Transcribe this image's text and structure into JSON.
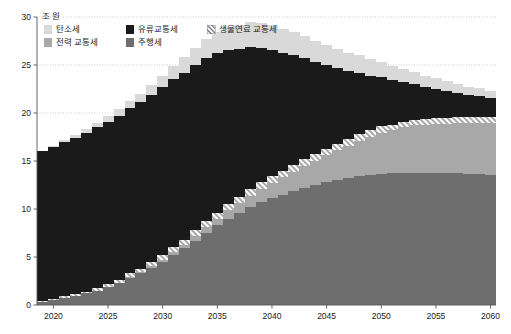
{
  "chart_data": {
    "type": "bar",
    "title": "",
    "subtitle": "",
    "unit_label": "조 원",
    "xlabel": "",
    "ylabel": "",
    "ylim": [
      0,
      30
    ],
    "xlim": [
      2018.5,
      2060.5
    ],
    "y_ticks": [
      "0",
      "5",
      "10",
      "15",
      "20",
      "25",
      "30"
    ],
    "y_tick_values": [
      0,
      5,
      10,
      15,
      20,
      25,
      30
    ],
    "x_ticks": [
      "2020",
      "2025",
      "2030",
      "2035",
      "2040",
      "2045",
      "2050",
      "2055",
      "2060"
    ],
    "x_tick_values": [
      2020,
      2025,
      2030,
      2035,
      2040,
      2045,
      2050,
      2055,
      2060
    ],
    "grid": "horizontal-dotted",
    "stacked": true,
    "legend_position": "top-left",
    "x": [
      2019,
      2020,
      2021,
      2022,
      2023,
      2024,
      2025,
      2026,
      2027,
      2028,
      2029,
      2030,
      2031,
      2032,
      2033,
      2034,
      2035,
      2036,
      2037,
      2038,
      2039,
      2040,
      2041,
      2042,
      2043,
      2044,
      2045,
      2046,
      2047,
      2048,
      2049,
      2050,
      2051,
      2052,
      2053,
      2054,
      2055,
      2056,
      2057,
      2058,
      2059,
      2060
    ],
    "series": [
      {
        "name": "주행세",
        "color": "#6e6e6e",
        "pattern": "solid",
        "values": [
          0.3,
          0.5,
          0.7,
          0.9,
          1.2,
          1.5,
          1.9,
          2.3,
          2.8,
          3.3,
          3.9,
          4.5,
          5.2,
          5.9,
          6.7,
          7.5,
          8.3,
          9.0,
          9.6,
          10.2,
          10.7,
          11.1,
          11.5,
          11.9,
          12.2,
          12.5,
          12.8,
          13.0,
          13.2,
          13.4,
          13.5,
          13.6,
          13.7,
          13.8,
          13.8,
          13.8,
          13.8,
          13.7,
          13.7,
          13.6,
          13.6,
          13.5
        ]
      },
      {
        "name": "전력 교통세",
        "color": "#a8a8a8",
        "pattern": "solid",
        "values": [
          0.0,
          0.0,
          0.0,
          0.0,
          0.0,
          0.0,
          0.0,
          0.0,
          0.1,
          0.1,
          0.2,
          0.2,
          0.3,
          0.4,
          0.5,
          0.6,
          0.7,
          0.9,
          1.0,
          1.2,
          1.4,
          1.6,
          1.8,
          2.0,
          2.3,
          2.5,
          2.8,
          3.1,
          3.4,
          3.7,
          4.0,
          4.3,
          4.5,
          4.7,
          4.9,
          5.0,
          5.1,
          5.2,
          5.3,
          5.4,
          5.4,
          5.5
        ]
      },
      {
        "name": "생물연료 교통세",
        "color": "#f2f2f2",
        "pattern": "diagonal-hatch",
        "values": [
          0.1,
          0.1,
          0.2,
          0.2,
          0.2,
          0.3,
          0.3,
          0.3,
          0.4,
          0.4,
          0.4,
          0.5,
          0.5,
          0.5,
          0.6,
          0.6,
          0.6,
          0.6,
          0.6,
          0.7,
          0.7,
          0.7,
          0.7,
          0.7,
          0.7,
          0.7,
          0.7,
          0.7,
          0.7,
          0.7,
          0.7,
          0.7,
          0.6,
          0.6,
          0.6,
          0.6,
          0.6,
          0.6,
          0.6,
          0.6,
          0.6,
          0.6
        ]
      },
      {
        "name": "유류교통세",
        "color": "#1a1a1a",
        "pattern": "solid",
        "values": [
          15.6,
          15.9,
          16.1,
          16.3,
          16.5,
          16.7,
          16.9,
          17.1,
          17.2,
          17.3,
          17.4,
          17.5,
          17.5,
          17.4,
          17.2,
          17.0,
          16.6,
          16.1,
          15.5,
          14.8,
          14.0,
          13.2,
          12.3,
          11.4,
          10.5,
          9.6,
          8.7,
          7.9,
          7.1,
          6.4,
          5.7,
          5.1,
          4.6,
          4.1,
          3.7,
          3.3,
          3.0,
          2.8,
          2.5,
          2.3,
          2.2,
          2.0
        ]
      },
      {
        "name": "탄소세",
        "color": "#d9d9d9",
        "pattern": "solid",
        "values": [
          0.0,
          0.1,
          0.2,
          0.3,
          0.4,
          0.5,
          0.6,
          0.7,
          0.8,
          0.9,
          1.0,
          1.2,
          1.4,
          1.6,
          1.8,
          2.0,
          2.2,
          2.4,
          2.5,
          2.6,
          2.6,
          2.6,
          2.5,
          2.4,
          2.3,
          2.2,
          2.1,
          2.0,
          1.9,
          1.8,
          1.7,
          1.6,
          1.5,
          1.4,
          1.3,
          1.2,
          1.1,
          1.0,
          0.9,
          0.8,
          0.8,
          0.7
        ]
      }
    ]
  }
}
